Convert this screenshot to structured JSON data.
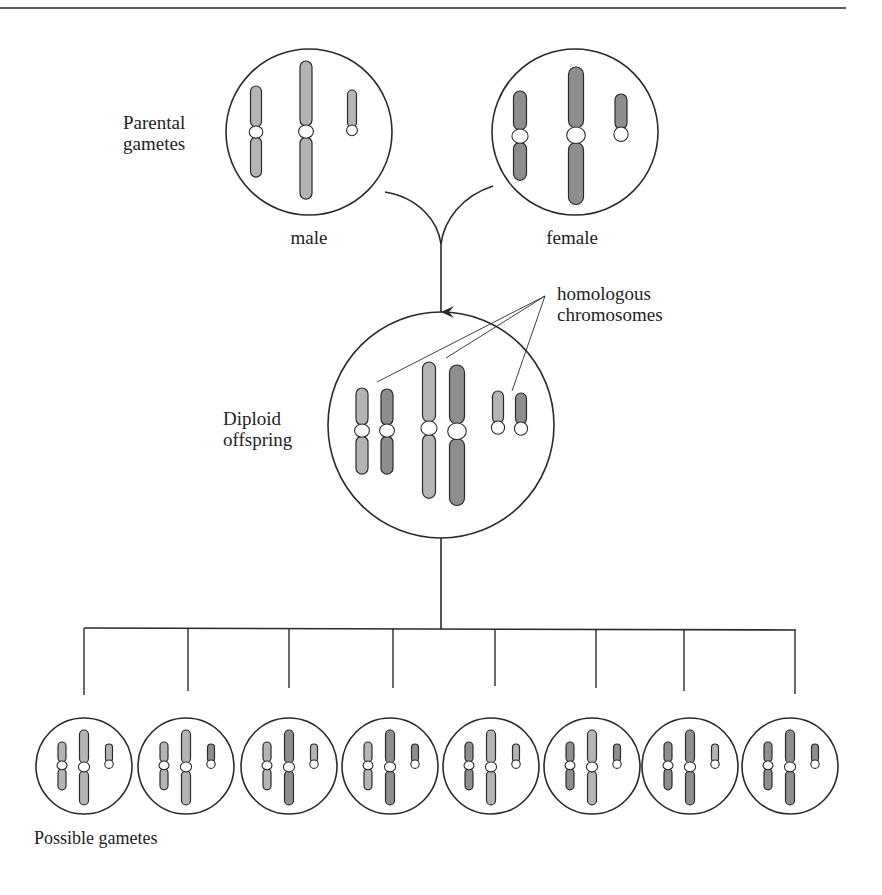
{
  "figure": {
    "labels": {
      "parental_line1": "Parental",
      "parental_line2": "gametes",
      "male": "male",
      "female": "female",
      "homologous_line1": "homologous",
      "homologous_line2": "chromosomes",
      "diploid_line1": "Diploid",
      "diploid_line2": "offspring",
      "possible_gametes": "Possible gametes"
    },
    "colors": {
      "stroke": "#2a2a2a",
      "male_chromosome": "#b4b4b4",
      "female_chromosome": "#8e8e8e",
      "centromere": "#ffffff",
      "background": "#ffffff"
    },
    "chromosome_pairs": [
      "medium metacentric",
      "long metacentric",
      "short acrocentric"
    ],
    "gametes": [
      {
        "id": 1,
        "medium": "male",
        "long": "male",
        "short": "male"
      },
      {
        "id": 2,
        "medium": "male",
        "long": "male",
        "short": "female"
      },
      {
        "id": 3,
        "medium": "male",
        "long": "female",
        "short": "male"
      },
      {
        "id": 4,
        "medium": "male",
        "long": "female",
        "short": "female"
      },
      {
        "id": 5,
        "medium": "female",
        "long": "male",
        "short": "male"
      },
      {
        "id": 6,
        "medium": "female",
        "long": "male",
        "short": "female"
      },
      {
        "id": 7,
        "medium": "female",
        "long": "female",
        "short": "male"
      },
      {
        "id": 8,
        "medium": "female",
        "long": "female",
        "short": "female"
      }
    ],
    "gamete_count": 8
  }
}
